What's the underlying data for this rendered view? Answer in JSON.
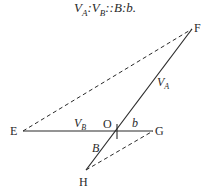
{
  "caption": {
    "v1": "V",
    "v1_sub": "A",
    "sep1": ":",
    "v2": "V",
    "v2_sub": "B",
    "rest": "::B:b."
  },
  "diagram": {
    "points": {
      "F": {
        "label": "F",
        "x": 192,
        "y": 29
      },
      "E": {
        "label": "E",
        "x": 23,
        "y": 131
      },
      "O": {
        "label": "O",
        "x": 116,
        "y": 131
      },
      "G": {
        "label": "G",
        "x": 153,
        "y": 131
      },
      "H": {
        "label": "H",
        "x": 86,
        "y": 170
      }
    },
    "segment_labels": {
      "VA": {
        "main": "V",
        "sub": "A"
      },
      "VB": {
        "main": "V",
        "sub": "B"
      },
      "b": "b",
      "B": "B"
    },
    "colors": {
      "line": "#2a2a2a"
    }
  }
}
